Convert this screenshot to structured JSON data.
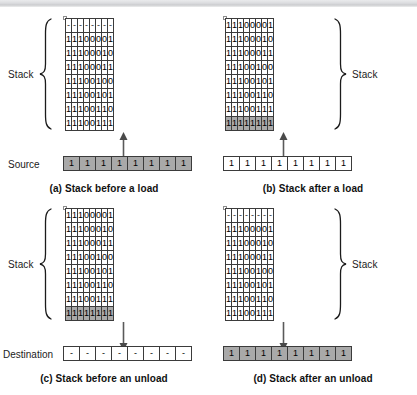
{
  "figure": {
    "stack_label": "Stack",
    "source_label": "Source",
    "destination_label": "Destination",
    "shade_color": "#a9a9a9",
    "line_color": "#3b3b3b"
  },
  "panels": [
    {
      "id": "a",
      "caption": "(a) Stack before a load",
      "brace_side": "left",
      "stack_label": "Stack",
      "arrow_direction": "up",
      "grid": [
        [
          "-",
          "-",
          "-",
          "-",
          "-",
          "-",
          "-",
          "-"
        ],
        [
          "1",
          "1",
          "1",
          "0",
          "0",
          "0",
          "0",
          "1"
        ],
        [
          "1",
          "1",
          "1",
          "0",
          "0",
          "0",
          "1",
          "0"
        ],
        [
          "1",
          "1",
          "1",
          "0",
          "0",
          "0",
          "1",
          "1"
        ],
        [
          "1",
          "1",
          "1",
          "0",
          "0",
          "1",
          "0",
          "0"
        ],
        [
          "1",
          "1",
          "1",
          "0",
          "0",
          "1",
          "0",
          "1"
        ],
        [
          "1",
          "1",
          "1",
          "0",
          "0",
          "1",
          "1",
          "0"
        ],
        [
          "1",
          "1",
          "1",
          "0",
          "0",
          "1",
          "1",
          "1"
        ]
      ],
      "grid_shaded_rows": [],
      "io_label": "Source",
      "io_row": [
        "1",
        "1",
        "1",
        "1",
        "1",
        "1",
        "1",
        "1"
      ],
      "io_shaded": true
    },
    {
      "id": "b",
      "caption": "(b) Stack after a load",
      "brace_side": "right",
      "stack_label": "Stack",
      "arrow_direction": "up",
      "grid": [
        [
          "1",
          "1",
          "1",
          "0",
          "0",
          "0",
          "0",
          "1"
        ],
        [
          "1",
          "1",
          "1",
          "0",
          "0",
          "0",
          "1",
          "0"
        ],
        [
          "1",
          "1",
          "1",
          "0",
          "0",
          "0",
          "1",
          "1"
        ],
        [
          "1",
          "1",
          "1",
          "0",
          "0",
          "1",
          "0",
          "0"
        ],
        [
          "1",
          "1",
          "1",
          "0",
          "0",
          "1",
          "0",
          "1"
        ],
        [
          "1",
          "1",
          "1",
          "0",
          "0",
          "1",
          "1",
          "0"
        ],
        [
          "1",
          "1",
          "1",
          "0",
          "0",
          "1",
          "1",
          "1"
        ],
        [
          "1",
          "1",
          "1",
          "1",
          "1",
          "1",
          "1",
          "1"
        ]
      ],
      "grid_shaded_rows": [
        7
      ],
      "io_label": "",
      "io_row": [
        "1",
        "1",
        "1",
        "1",
        "1",
        "1",
        "1",
        "1"
      ],
      "io_shaded": false
    },
    {
      "id": "c",
      "caption": "(c) Stack before an unload",
      "brace_side": "left",
      "stack_label": "Stack",
      "arrow_direction": "down",
      "grid": [
        [
          "1",
          "1",
          "1",
          "0",
          "0",
          "0",
          "0",
          "1"
        ],
        [
          "1",
          "1",
          "1",
          "0",
          "0",
          "0",
          "1",
          "0"
        ],
        [
          "1",
          "1",
          "1",
          "0",
          "0",
          "0",
          "1",
          "1"
        ],
        [
          "1",
          "1",
          "1",
          "0",
          "0",
          "1",
          "0",
          "0"
        ],
        [
          "1",
          "1",
          "1",
          "0",
          "0",
          "1",
          "0",
          "1"
        ],
        [
          "1",
          "1",
          "1",
          "0",
          "0",
          "1",
          "1",
          "0"
        ],
        [
          "1",
          "1",
          "1",
          "0",
          "0",
          "1",
          "1",
          "1"
        ],
        [
          "1",
          "1",
          "1",
          "1",
          "1",
          "1",
          "1",
          "1"
        ]
      ],
      "grid_shaded_rows": [
        7
      ],
      "io_label": "Destination",
      "io_row": [
        "-",
        "-",
        "-",
        "-",
        "-",
        "-",
        "-",
        "-"
      ],
      "io_shaded": false
    },
    {
      "id": "d",
      "caption": "(d) Stack after an unload",
      "brace_side": "right",
      "stack_label": "Stack",
      "arrow_direction": "down",
      "grid": [
        [
          "-",
          "-",
          "-",
          "-",
          "-",
          "-",
          "-",
          "-"
        ],
        [
          "1",
          "1",
          "1",
          "0",
          "0",
          "0",
          "0",
          "1"
        ],
        [
          "1",
          "1",
          "1",
          "0",
          "0",
          "0",
          "1",
          "0"
        ],
        [
          "1",
          "1",
          "1",
          "0",
          "0",
          "0",
          "1",
          "1"
        ],
        [
          "1",
          "1",
          "1",
          "0",
          "0",
          "1",
          "0",
          "0"
        ],
        [
          "1",
          "1",
          "1",
          "0",
          "0",
          "1",
          "0",
          "1"
        ],
        [
          "1",
          "1",
          "1",
          "0",
          "0",
          "1",
          "1",
          "0"
        ],
        [
          "1",
          "1",
          "1",
          "0",
          "0",
          "1",
          "1",
          "1"
        ]
      ],
      "grid_shaded_rows": [],
      "io_label": "",
      "io_row": [
        "1",
        "1",
        "1",
        "1",
        "1",
        "1",
        "1",
        "1"
      ],
      "io_shaded": true
    }
  ]
}
